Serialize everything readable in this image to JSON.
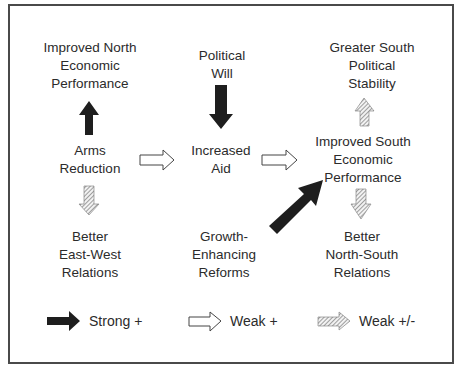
{
  "diagram": {
    "nodes": {
      "north_econ": {
        "lines": [
          "Improved North",
          "Economic",
          "Performance"
        ]
      },
      "political_will": {
        "lines": [
          "Political",
          "Will"
        ]
      },
      "south_stability": {
        "lines": [
          "Greater South",
          "Political",
          "Stability"
        ]
      },
      "arms_reduction": {
        "lines": [
          "Arms",
          "Reduction"
        ]
      },
      "increased_aid": {
        "lines": [
          "Increased",
          "Aid"
        ]
      },
      "south_econ": {
        "lines": [
          "Improved South",
          "Economic",
          "Performance"
        ]
      },
      "east_west": {
        "lines": [
          "Better",
          "East-West",
          "Relations"
        ]
      },
      "growth_reforms": {
        "lines": [
          "Growth-",
          "Enhancing",
          "Reforms"
        ]
      },
      "north_south": {
        "lines": [
          "Better",
          "North-South",
          "Relations"
        ]
      }
    },
    "edges": [
      {
        "from": "arms_reduction",
        "to": "north_econ",
        "type": "strong_positive"
      },
      {
        "from": "arms_reduction",
        "to": "increased_aid",
        "type": "weak_positive"
      },
      {
        "from": "arms_reduction",
        "to": "east_west",
        "type": "weak_mixed"
      },
      {
        "from": "political_will",
        "to": "increased_aid",
        "type": "strong_positive"
      },
      {
        "from": "increased_aid",
        "to": "south_econ",
        "type": "weak_positive"
      },
      {
        "from": "growth_reforms",
        "to": "south_econ",
        "type": "strong_positive"
      },
      {
        "from": "south_econ",
        "to": "south_stability",
        "type": "weak_mixed"
      },
      {
        "from": "south_econ",
        "to": "north_south",
        "type": "weak_mixed"
      }
    ],
    "legend": [
      {
        "type": "strong_positive",
        "label": "Strong +"
      },
      {
        "type": "weak_positive",
        "label": "Weak +"
      },
      {
        "type": "weak_mixed",
        "label": "Weak +/-"
      }
    ],
    "colors": {
      "strong": "#1e1e1e",
      "weak_outline": "#444444",
      "hatch": "#8a8a8a",
      "frame": "#4a4a4a"
    }
  }
}
